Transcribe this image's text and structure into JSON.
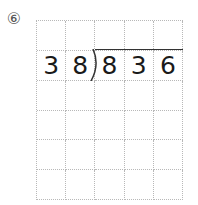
{
  "problem": {
    "number_label": "⑥",
    "divisor": "38",
    "dividend": "836"
  },
  "grid": {
    "columns": 5,
    "rows": 6,
    "cells": [
      [
        "",
        "",
        "",
        "",
        ""
      ],
      [
        "3",
        "8",
        "8",
        "3",
        "6"
      ],
      [
        "",
        "",
        "",
        "",
        ""
      ],
      [
        "",
        "",
        "",
        "",
        ""
      ],
      [
        "",
        "",
        "",
        "",
        ""
      ],
      [
        "",
        "",
        "",
        "",
        ""
      ]
    ]
  }
}
